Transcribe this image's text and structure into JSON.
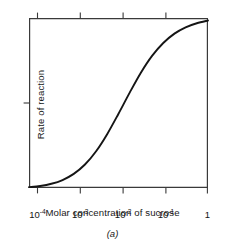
{
  "figure": {
    "caption": "(a)",
    "background_color": "#ffffff",
    "line_color": "#151515",
    "axis_color": "#3a3a3a"
  },
  "chart_data": {
    "type": "line",
    "title": "",
    "subtitle": "",
    "xlabel": "Molar concentration of sucrose",
    "ylabel": "Rate of reaction",
    "xscale": "log",
    "yscale": "linear",
    "xlim": [
      0.0001,
      1
    ],
    "ylim": [
      0,
      1
    ],
    "grid": false,
    "legend": "none",
    "x_tick_labels": [
      "10−4",
      "10−3",
      "10−2",
      "10−1",
      "1"
    ],
    "x_tick_mantissas": [
      "10",
      "10",
      "10",
      "10",
      "1"
    ],
    "x_tick_exponents": [
      "-4",
      "-3",
      "-2",
      "-1",
      ""
    ],
    "x_tick_values": [
      0.0001,
      0.001,
      0.01,
      0.1,
      1
    ],
    "y_tick_labels": [],
    "y_ticks_shown": 1,
    "annotations": [],
    "series": [
      {
        "name": "Rate of reaction vs sucrose concentration",
        "x": [
          0.0001,
          0.000178,
          0.000316,
          0.000562,
          0.001,
          0.00178,
          0.00316,
          0.00562,
          0.01,
          0.0178,
          0.0316,
          0.0562,
          0.1,
          0.178,
          0.316,
          0.562,
          1.0
        ],
        "values": [
          0.005,
          0.012,
          0.025,
          0.047,
          0.083,
          0.138,
          0.216,
          0.318,
          0.437,
          0.561,
          0.678,
          0.777,
          0.853,
          0.908,
          0.945,
          0.969,
          0.985
        ]
      }
    ]
  }
}
